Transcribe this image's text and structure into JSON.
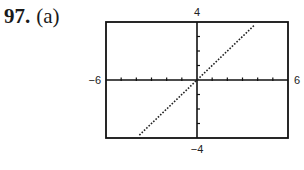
{
  "problem": {
    "number": "97.",
    "part": "(a)"
  },
  "chart_data": {
    "type": "line",
    "title": "",
    "xlabel": "",
    "ylabel": "",
    "xlim": [
      -6,
      6
    ],
    "ylim": [
      -4,
      4
    ],
    "x_ticks": {
      "step": 1,
      "labels": {
        "min": "−6",
        "max": "6"
      }
    },
    "y_ticks": {
      "step": 1,
      "labels": {
        "min": "−4",
        "max": "4"
      }
    },
    "grid": false,
    "series": [
      {
        "name": "y = x",
        "style": "dotted",
        "x": [
          -3.8,
          3.8
        ],
        "y": [
          -3.8,
          3.8
        ]
      }
    ]
  }
}
